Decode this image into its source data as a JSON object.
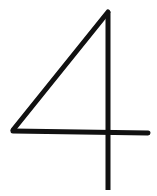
{
  "glyph": {
    "character": "4",
    "stroke_color": "#111111",
    "background": "#ffffff"
  }
}
